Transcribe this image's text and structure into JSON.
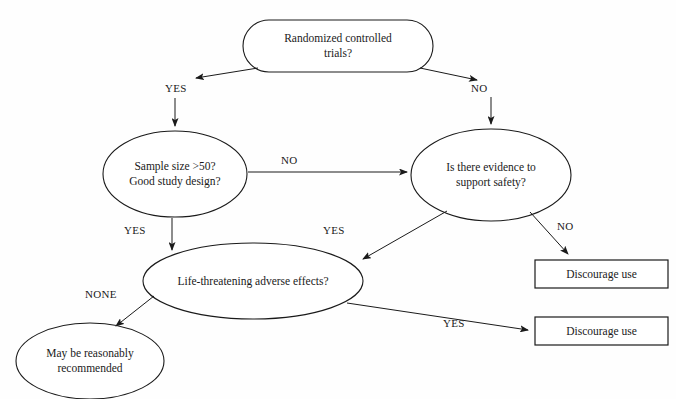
{
  "diagram": {
    "type": "flowchart",
    "background_color": "#fefefe",
    "stroke_color": "#1a1a1a",
    "text_color": "#1a1a1a",
    "nodes": [
      {
        "id": "rct",
        "shape": "rounded-rectangle",
        "label": "Randomized controlled\ntrials?",
        "x": 243,
        "y": 20,
        "w": 190,
        "h": 52
      },
      {
        "id": "sample-size",
        "shape": "ellipse",
        "label": "Sample size >50?\nGood study design?",
        "x": 103,
        "y": 131,
        "w": 144,
        "h": 86
      },
      {
        "id": "evidence-safety",
        "shape": "ellipse",
        "label": "Is there evidence to\nsupport safety?",
        "x": 411,
        "y": 129,
        "w": 160,
        "h": 92
      },
      {
        "id": "life-threatening",
        "shape": "ellipse",
        "label": "Life-threatening adverse effects?",
        "x": 143,
        "y": 243,
        "w": 220,
        "h": 76
      },
      {
        "id": "recommend",
        "shape": "ellipse",
        "label": "May be reasonably\nrecommended",
        "x": 16,
        "y": 323,
        "w": 148,
        "h": 76
      },
      {
        "id": "discourage-1",
        "shape": "rectangle",
        "label": "Discourage use",
        "x": 535,
        "y": 260,
        "w": 133,
        "h": 28
      },
      {
        "id": "discourage-2",
        "shape": "rectangle",
        "label": "Discourage use",
        "x": 535,
        "y": 317,
        "w": 133,
        "h": 28
      }
    ],
    "edges": [
      {
        "id": "rct-yes",
        "from": "rct",
        "to": "sample-size",
        "label": "YES",
        "label_x": 165,
        "label_y": 82
      },
      {
        "id": "rct-no",
        "from": "rct",
        "to": "evidence-safety",
        "label": "NO",
        "label_x": 471,
        "label_y": 82
      },
      {
        "id": "sample-no",
        "from": "sample-size",
        "to": "evidence-safety",
        "label": "NO",
        "label_x": 281,
        "label_y": 154
      },
      {
        "id": "sample-yes",
        "from": "sample-size",
        "to": "life-threatening",
        "label": "YES",
        "label_x": 124,
        "label_y": 224
      },
      {
        "id": "evidence-yes",
        "from": "evidence-safety",
        "to": "life-threatening",
        "label": "YES",
        "label_x": 323,
        "label_y": 224
      },
      {
        "id": "evidence-no",
        "from": "evidence-safety",
        "to": "discourage-1",
        "label": "NO",
        "label_x": 557,
        "label_y": 220
      },
      {
        "id": "life-none",
        "from": "life-threatening",
        "to": "recommend",
        "label": "NONE",
        "label_x": 85,
        "label_y": 288
      },
      {
        "id": "life-yes",
        "from": "life-threatening",
        "to": "discourage-2",
        "label": "YES",
        "label_x": 443,
        "label_y": 317
      }
    ]
  }
}
